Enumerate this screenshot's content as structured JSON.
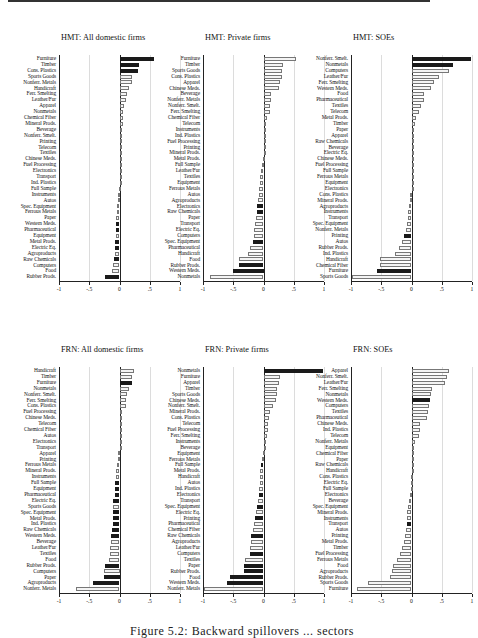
{
  "figure": {
    "caption": "Figure 5.2: Backward spillovers ... sectors"
  },
  "chart_data": [
    {
      "type": "bar",
      "orientation": "horizontal",
      "title": "HMT: All domestic firms",
      "xlim": [
        -1,
        1
      ],
      "xticks": [
        "-1",
        "-.5",
        "0",
        ".5",
        "1"
      ],
      "grid": true,
      "categories": [
        "Furniture",
        "Timber",
        "Cons. Plastics",
        "Sports Goods",
        "Nonferr. Metals",
        "Handicraft",
        "Ferr. Smelting",
        "Leather/Fur",
        "Apparel",
        "Nonmetals",
        "Chemical Fiber",
        "Mineral Prods.",
        "Beverage",
        "Nonferr. Smelt.",
        "Printing",
        "Telecom",
        "Textiles",
        "Chinese Meds.",
        "Fuel Processing",
        "Electronics",
        "Transport",
        "Ind. Plastics",
        "Full Sample",
        "Instruments",
        "Autos",
        "Spec. Equipment",
        "Ferrous Metals",
        "Paper",
        "Western Meds.",
        "Pharmaceutical",
        "Equipment",
        "Metal Prods.",
        "Electric Eq.",
        "Agroproducts",
        "Raw Chemicals",
        "Computers",
        "Food",
        "Rubber Prods."
      ],
      "values": [
        0.57,
        0.33,
        0.3,
        0.2,
        0.2,
        0.15,
        0.12,
        0.1,
        0.08,
        0.06,
        0.05,
        0.05,
        0.04,
        0.03,
        0.03,
        0.02,
        0.02,
        0.02,
        0.02,
        0.01,
        0.01,
        0.01,
        -0.01,
        -0.02,
        -0.03,
        -0.04,
        -0.04,
        -0.05,
        -0.05,
        -0.06,
        -0.06,
        -0.07,
        -0.08,
        -0.08,
        -0.09,
        -0.1,
        -0.12,
        -0.24
      ],
      "significant": [
        1,
        1,
        1,
        0,
        0,
        0,
        0,
        0,
        0,
        0,
        0,
        0,
        0,
        0,
        0,
        0,
        0,
        0,
        0,
        0,
        0,
        0,
        0,
        0,
        0,
        0,
        0,
        0,
        1,
        1,
        0,
        1,
        1,
        0,
        1,
        0,
        0,
        1
      ]
    },
    {
      "type": "bar",
      "orientation": "horizontal",
      "title": "HMT: Private firms",
      "xlim": [
        -1,
        1
      ],
      "xticks": [
        "-1",
        "-.5",
        "0",
        ".5",
        "1"
      ],
      "grid": true,
      "categories": [
        "Furniture",
        "Timber",
        "Sports Goods",
        "Cons. Plastics",
        "Apparel",
        "Chinese Meds.",
        "Beverage",
        "Nonferr. Metals",
        "Nonferr. Smelt.",
        "Ferr. Smelting",
        "Chemical Fiber",
        "Telecom",
        "Instruments",
        "Ind. Plastics",
        "Fuel Processing",
        "Printing",
        "Mineral Prods.",
        "Metal Prods.",
        "Full Sample",
        "Leather/Fur",
        "Textiles",
        "Equipment",
        "Ferrous Metals",
        "Autos",
        "Agroproducts",
        "Electronics",
        "Raw Chemicals",
        "Paper",
        "Transport",
        "Electric Eq.",
        "Computers",
        "Spec. Equipment",
        "Pharmaceutical",
        "Handicraft",
        "Food",
        "Rubber Prods.",
        "Western Meds.",
        "Nonmetals"
      ],
      "values": [
        0.53,
        0.33,
        0.31,
        0.3,
        0.27,
        0.25,
        0.13,
        0.12,
        0.1,
        0.1,
        0.05,
        0.04,
        0.02,
        0.02,
        0.01,
        0.01,
        0.01,
        -0.01,
        -0.03,
        -0.04,
        -0.05,
        -0.06,
        -0.07,
        -0.08,
        -0.09,
        -0.1,
        -0.11,
        -0.12,
        -0.14,
        -0.15,
        -0.16,
        -0.18,
        -0.23,
        -0.26,
        -0.4,
        -0.41,
        -0.5,
        -0.88
      ],
      "significant": [
        0,
        0,
        0,
        0,
        0,
        0,
        0,
        0,
        0,
        0,
        0,
        0,
        0,
        0,
        0,
        0,
        0,
        0,
        0,
        0,
        0,
        0,
        0,
        0,
        0,
        1,
        1,
        0,
        0,
        0,
        0,
        1,
        0,
        0,
        0,
        1,
        1,
        0
      ]
    },
    {
      "type": "bar",
      "orientation": "horizontal",
      "title": "HMT: SOEs",
      "xlim": [
        -1,
        1
      ],
      "xticks": [
        "-1",
        "-.5",
        "0",
        ".5",
        "1"
      ],
      "grid": true,
      "categories": [
        "Nonferr. Smelt.",
        "Nonmetals",
        "Computers",
        "Leather/Fur",
        "Ferr. Smelting",
        "Western Meds.",
        "Food",
        "Pharmaceutical",
        "Textiles",
        "Telecom",
        "Metal Prods.",
        "Timber",
        "Paper",
        "Apparel",
        "Raw Chemicals",
        "Beverage",
        "Electric Eq.",
        "Chinese Meds.",
        "Fuel Processing",
        "Full Sample",
        "Ferrous Metals",
        "Equipment",
        "Electronics",
        "Cons. Plastics",
        "Mineral Prods.",
        "Agroproducts",
        "Instruments",
        "Transport",
        "Spec. Equipment",
        "Nonferr. Metals",
        "Printing",
        "Autos",
        "Rubber Prods.",
        "Ind. Plastics",
        "Handicraft",
        "Chemical Fiber",
        "Furniture",
        "Sports Goods"
      ],
      "values": [
        0.98,
        0.68,
        0.62,
        0.45,
        0.38,
        0.33,
        0.2,
        0.2,
        0.15,
        0.13,
        0.08,
        0.06,
        0.04,
        0.03,
        0.03,
        0.02,
        0.02,
        0.01,
        0.01,
        0.01,
        0.01,
        0.01,
        0.01,
        -0.02,
        -0.03,
        -0.04,
        -0.05,
        -0.06,
        -0.07,
        -0.09,
        -0.13,
        -0.16,
        -0.2,
        -0.27,
        -0.52,
        -0.52,
        -0.57,
        -0.98
      ],
      "significant": [
        1,
        1,
        0,
        0,
        0,
        0,
        0,
        0,
        0,
        0,
        0,
        0,
        0,
        0,
        0,
        0,
        0,
        0,
        0,
        0,
        0,
        0,
        0,
        0,
        0,
        0,
        0,
        0,
        0,
        0,
        1,
        0,
        0,
        0,
        0,
        0,
        1,
        0
      ]
    },
    {
      "type": "bar",
      "orientation": "horizontal",
      "title": "FRN: All domestic firms",
      "xlim": [
        -1,
        1
      ],
      "xticks": [
        "-1",
        "-.5",
        "0",
        ".5",
        "1"
      ],
      "grid": true,
      "categories": [
        "Handicraft",
        "Timber",
        "Furniture",
        "Nonmetals",
        "Nonferr. Smelt.",
        "Ferr. Smelting",
        "Cons. Plastics",
        "Fuel Processing",
        "Chinese Meds.",
        "Telecom",
        "Chemical Fiber",
        "Autos",
        "Electronics",
        "Transport",
        "Apparel",
        "Printing",
        "Ferrous Metals",
        "Mineral Prods.",
        "Instruments",
        "Full Sample",
        "Equipment",
        "Pharmaceutical",
        "Electric Eq.",
        "Sports Goods",
        "Spec. Equipment",
        "Metal Prods.",
        "Ind. Plastics",
        "Raw Chemicals",
        "Western Meds.",
        "Beverage",
        "Leather/Fur",
        "Textiles",
        "Food",
        "Rubber Prods.",
        "Computers",
        "Paper",
        "Agroproducts",
        "Nonferr. Metals"
      ],
      "values": [
        0.24,
        0.2,
        0.2,
        0.15,
        0.12,
        0.1,
        0.1,
        0.02,
        0.01,
        0.01,
        0.01,
        0.01,
        0.01,
        0.01,
        -0.02,
        -0.03,
        -0.04,
        -0.05,
        -0.05,
        -0.07,
        -0.07,
        -0.08,
        -0.1,
        -0.1,
        -0.1,
        -0.11,
        -0.11,
        -0.13,
        -0.14,
        -0.14,
        -0.15,
        -0.16,
        -0.17,
        -0.24,
        -0.25,
        -0.25,
        -0.44,
        -0.72
      ],
      "significant": [
        0,
        0,
        1,
        0,
        0,
        0,
        0,
        0,
        0,
        0,
        0,
        0,
        0,
        0,
        0,
        0,
        0,
        0,
        0,
        1,
        1,
        1,
        1,
        0,
        1,
        1,
        1,
        1,
        1,
        0,
        0,
        0,
        0,
        1,
        0,
        1,
        1,
        0
      ]
    },
    {
      "type": "bar",
      "orientation": "horizontal",
      "title": "FRN: Private firms",
      "xlim": [
        -1,
        1
      ],
      "xticks": [
        "-1",
        "-.5",
        "0",
        ".5",
        "1"
      ],
      "grid": true,
      "categories": [
        "Nonmetals",
        "Furniture",
        "Apparel",
        "Timber",
        "Sports Goods",
        "Chinese Meds.",
        "Nonferr. Smelt.",
        "Mineral Prods.",
        "Cons. Plastics",
        "Telecom",
        "Fuel Processing",
        "Ferr. Smelting",
        "Instruments",
        "Beverage",
        "Equipment",
        "Ferrous Metals",
        "Full Sample",
        "Metal Prods.",
        "Handicraft",
        "Autos",
        "Ind. Plastics",
        "Electronics",
        "Transport",
        "Spec. Equipment",
        "Electric Eq.",
        "Printing",
        "Pharmaceutical",
        "Chemical Fiber",
        "Raw Chemicals",
        "Agroproducts",
        "Leather/Fur",
        "Computers",
        "Textiles",
        "Paper",
        "Rubber Prods.",
        "Food",
        "Western Meds.",
        "Nonferr. Metals"
      ],
      "values": [
        0.98,
        0.28,
        0.25,
        0.23,
        0.23,
        0.2,
        0.15,
        0.1,
        0.09,
        0.08,
        0.07,
        0.05,
        0.01,
        0.01,
        -0.01,
        -0.03,
        -0.04,
        -0.05,
        -0.05,
        -0.06,
        -0.07,
        -0.08,
        -0.09,
        -0.11,
        -0.12,
        -0.14,
        -0.16,
        -0.17,
        -0.2,
        -0.21,
        -0.22,
        -0.23,
        -0.3,
        -0.32,
        -0.33,
        -0.55,
        -0.6,
        -0.98
      ],
      "significant": [
        1,
        0,
        0,
        0,
        0,
        0,
        0,
        0,
        0,
        0,
        0,
        0,
        0,
        0,
        0,
        0,
        1,
        0,
        0,
        0,
        0,
        1,
        0,
        1,
        0,
        1,
        0,
        0,
        1,
        0,
        0,
        1,
        0,
        1,
        1,
        1,
        1,
        0
      ]
    },
    {
      "type": "bar",
      "orientation": "horizontal",
      "title": "FRN: SOEs",
      "xlim": [
        -1,
        1
      ],
      "xticks": [
        "-1",
        "-.5",
        "0",
        ".5",
        "1"
      ],
      "grid": true,
      "categories": [
        "Apparel",
        "Nonferr. Smelt.",
        "Leather/Fur",
        "Ferr. Smelting",
        "Nonmetals",
        "Western Meds.",
        "Computers",
        "Textiles",
        "Pharmaceutical",
        "Chinese Meds.",
        "Ind. Plastics",
        "Telecom",
        "Nonferr. Metals",
        "Equipment",
        "Chemical Fiber",
        "Paper",
        "Raw Chemicals",
        "Handicraft",
        "Cons. Plastics",
        "Electric Eq.",
        "Full Sample",
        "Electronics",
        "Beverage",
        "Spec. Equipment",
        "Mineral Prods.",
        "Instruments",
        "Transport",
        "Autos",
        "Printing",
        "Metal Prods.",
        "Timber",
        "Fuel Processing",
        "Ferrous Metals",
        "Food",
        "Agroproducts",
        "Rubber Prods.",
        "Sports Goods",
        "Furniture"
      ],
      "values": [
        0.62,
        0.58,
        0.56,
        0.34,
        0.33,
        0.3,
        0.29,
        0.28,
        0.26,
        0.14,
        0.14,
        0.12,
        0.06,
        0.04,
        0.03,
        0.02,
        0.01,
        0.01,
        -0.01,
        -0.01,
        -0.01,
        -0.02,
        -0.04,
        -0.06,
        -0.07,
        -0.08,
        -0.08,
        -0.09,
        -0.1,
        -0.13,
        -0.16,
        -0.19,
        -0.24,
        -0.3,
        -0.32,
        -0.36,
        -0.72,
        -0.9
      ],
      "significant": [
        0,
        0,
        0,
        0,
        0,
        1,
        0,
        0,
        0,
        0,
        0,
        0,
        0,
        0,
        0,
        0,
        0,
        0,
        0,
        0,
        0,
        0,
        0,
        0,
        0,
        0,
        1,
        0,
        0,
        0,
        0,
        0,
        0,
        0,
        0,
        0,
        0,
        0
      ]
    }
  ]
}
